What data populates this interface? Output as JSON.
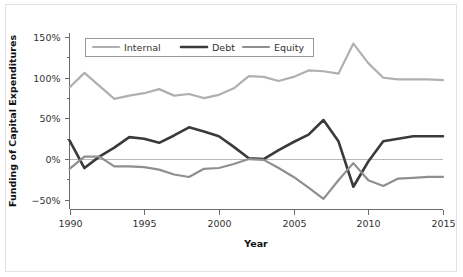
{
  "chart_data": {
    "type": "line",
    "title": "",
    "xlabel": "Year",
    "ylabel": "Funding of Capital Expenditures",
    "xlim": [
      1990,
      2015
    ],
    "ylim": [
      -62,
      155
    ],
    "xticks": [
      1990,
      1995,
      2000,
      2005,
      2010,
      2015
    ],
    "xtick_labels": [
      "1990",
      "1995",
      "2000",
      "2005",
      "2010",
      "2015"
    ],
    "yticks": [
      -50,
      0,
      50,
      100,
      150
    ],
    "ytick_labels": [
      "−50%",
      "0%",
      "50%",
      "100%",
      "150%"
    ],
    "yminorticks": [
      -25,
      25,
      75,
      125
    ],
    "grid": false,
    "zero_line": true,
    "legend_position": "top-left-inside",
    "x": [
      1990,
      1991,
      1992,
      1993,
      1994,
      1995,
      1996,
      1997,
      1998,
      1999,
      2000,
      2001,
      2002,
      2003,
      2004,
      2005,
      2006,
      2007,
      2008,
      2009,
      2010,
      2011,
      2012,
      2013,
      2014,
      2015
    ],
    "series": [
      {
        "name": "Internal",
        "color": "#b0b0b0",
        "width": 2.2,
        "values": [
          88,
          106,
          90,
          74,
          78,
          81,
          86,
          78,
          80,
          75,
          79,
          87,
          102,
          101,
          96,
          101,
          109,
          108,
          105,
          142,
          118,
          100,
          98,
          98,
          98,
          97
        ]
      },
      {
        "name": "Debt",
        "color": "#3a3a3a",
        "width": 2.6,
        "values": [
          23,
          -11,
          3,
          14,
          27,
          25,
          20,
          29,
          39,
          34,
          28,
          15,
          1,
          0,
          11,
          21,
          30,
          48,
          22,
          -34,
          -3,
          22,
          25,
          28,
          28,
          28
        ]
      },
      {
        "name": "Equity",
        "color": "#8f8f8f",
        "width": 2.2,
        "values": [
          -12,
          3,
          3,
          -9,
          -9,
          -10,
          -13,
          -19,
          -22,
          -12,
          -11,
          -6,
          0,
          -1,
          -11,
          -22,
          -35,
          -49,
          -26,
          -5,
          -26,
          -33,
          -24,
          -23,
          -22,
          -22
        ]
      }
    ]
  }
}
